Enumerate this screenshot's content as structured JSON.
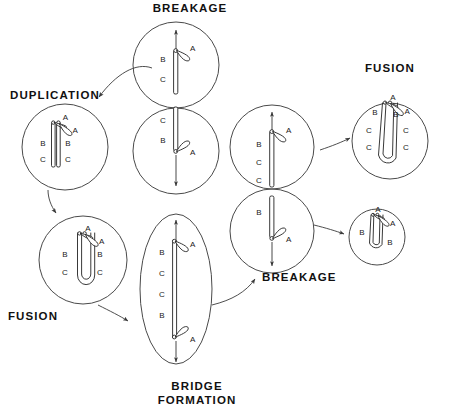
{
  "diagram": {
    "background": "#ffffff",
    "ink": "#222222",
    "cell_outline": "#4a4a4a"
  },
  "stage_labels": {
    "breakage_top": "BREAKAGE",
    "duplication": "DUPLICATION",
    "fusion_left": "FUSION",
    "bridge_formation_line1": "BRIDGE",
    "bridge_formation_line2": "FORMATION",
    "breakage_right": "BREAKAGE",
    "fusion_right": "FUSION"
  },
  "cells": {
    "breakage_top": {
      "name": "breakage-top-cell",
      "shape": "figure-eight",
      "upper_daughter": {
        "arm_labels": [
          "B",
          "C"
        ],
        "marker_labels": [
          "A"
        ],
        "pole_arrow": "up"
      },
      "lower_daughter": {
        "arm_labels": [
          "C",
          "B"
        ],
        "marker_labels": [
          "A"
        ],
        "pole_arrow": "down"
      }
    },
    "duplication": {
      "name": "duplication-cell",
      "shape": "circle",
      "left_chromatid_labels": [
        "B",
        "C"
      ],
      "right_chromatid_labels": [
        "B",
        "C"
      ],
      "marker_labels": [
        "A",
        "A"
      ]
    },
    "fusion_left": {
      "name": "fusion-left-cell",
      "shape": "circle",
      "left_arm_labels": [
        "B",
        "C"
      ],
      "right_arm_labels": [
        "B",
        "C"
      ],
      "marker_labels": [
        "A",
        "A"
      ]
    },
    "bridge_formation": {
      "name": "bridge-formation-cell",
      "shape": "ellipse",
      "bridge_labels": [
        "B",
        "C",
        "C",
        "B"
      ],
      "marker_labels": [
        "A",
        "A"
      ],
      "pole_arrows": [
        "up",
        "down"
      ]
    },
    "breakage_right": {
      "name": "breakage-right-cell",
      "shape": "figure-eight",
      "upper_daughter": {
        "arm_labels": [
          "B",
          "C",
          "C"
        ],
        "marker_labels": [
          "A"
        ],
        "pole_arrow": "up"
      },
      "lower_daughter": {
        "arm_labels": [
          "B"
        ],
        "marker_labels": [
          "A"
        ],
        "pole_arrow": "down"
      }
    },
    "fusion_right_upper": {
      "name": "fusion-right-upper-cell",
      "shape": "circle",
      "marker_labels": [
        "A",
        "A"
      ],
      "left_arm_labels": [
        "B",
        "C",
        "C"
      ],
      "right_arm_labels": [
        "B",
        "C",
        "C"
      ]
    },
    "fusion_right_lower": {
      "name": "fusion-right-lower-cell",
      "shape": "circle",
      "marker_labels": [
        "A",
        "A"
      ],
      "left_arm_labels": [
        "B"
      ],
      "right_arm_labels": [
        "B"
      ]
    }
  },
  "flow_arrows": [
    {
      "from": "breakage_top",
      "to": "duplication"
    },
    {
      "from": "duplication",
      "to": "fusion_left"
    },
    {
      "from": "fusion_left",
      "to": "bridge_formation"
    },
    {
      "from": "bridge_formation",
      "to": "breakage_right"
    },
    {
      "from": "breakage_right",
      "to": "fusion_right_upper"
    },
    {
      "from": "breakage_right",
      "to": "fusion_right_lower"
    }
  ]
}
